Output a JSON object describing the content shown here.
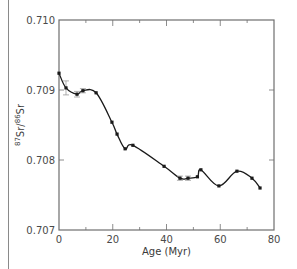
{
  "chart_data": {
    "type": "line",
    "title": "",
    "xlabel": "Age (Myr)",
    "ylabel": "87Sr/86Sr",
    "ylabel_parts": {
      "sup1": "87",
      "base1": "Sr/",
      "sup2": "86",
      "base2": "Sr"
    },
    "xlim": [
      0,
      80
    ],
    "ylim": [
      0.707,
      0.71
    ],
    "x_ticks": [
      0,
      20,
      40,
      60,
      80
    ],
    "x_tick_labels": [
      "0",
      "20",
      "40",
      "60",
      "80"
    ],
    "x_minor_ticks": [
      10,
      30,
      50,
      70
    ],
    "y_ticks": [
      0.707,
      0.708,
      0.709,
      0.71
    ],
    "y_tick_labels": [
      "0.707",
      "0.708",
      "0.709",
      "0.710"
    ],
    "grid": false,
    "legend": null,
    "series": [
      {
        "name": "Seawater 87Sr/86Sr",
        "x": [
          0,
          2.6,
          6.7,
          8.9,
          13.8,
          19.7,
          21.6,
          24.6,
          27.5,
          39.1,
          45.0,
          48.0,
          51.5,
          52.8,
          59.5,
          66.2,
          71.8,
          74.8
        ],
        "y": [
          0.70924,
          0.70903,
          0.70894,
          0.70899,
          0.70896,
          0.70854,
          0.70837,
          0.70816,
          0.70821,
          0.70791,
          0.70774,
          0.70774,
          0.70776,
          0.70786,
          0.70763,
          0.70784,
          0.70774,
          0.7076
        ],
        "error_bars": [
          {
            "x": 2.6,
            "y": 0.70903,
            "err": 0.0001
          },
          {
            "x": 6.7,
            "y": 0.70894,
            "err": 4e-05
          },
          {
            "x": 8.9,
            "y": 0.70899,
            "err": 3e-05
          },
          {
            "x": 45.0,
            "y": 0.70774,
            "err": 3e-05
          },
          {
            "x": 48.0,
            "y": 0.70774,
            "err": 3e-05
          }
        ]
      }
    ]
  },
  "colors": {
    "line": "#1a1a1a",
    "axis": "#6e6e6e",
    "text": "#4a4a4a"
  }
}
